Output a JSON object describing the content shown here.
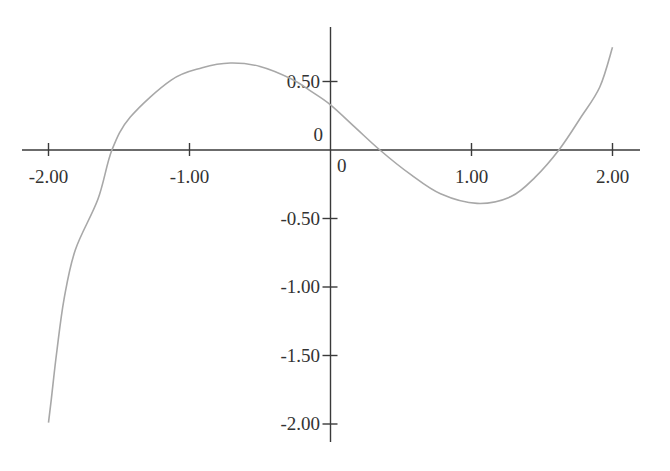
{
  "chart_data": {
    "type": "line",
    "title": "",
    "xlabel": "",
    "ylabel": "",
    "xlim": [
      -2.2,
      2.2
    ],
    "ylim": [
      -2.1,
      0.9
    ],
    "grid": false,
    "legend": null,
    "x_ticks": [
      {
        "value": -2,
        "label": "-2.00"
      },
      {
        "value": -1,
        "label": "-1.00"
      },
      {
        "value": 1,
        "label": "1.00"
      },
      {
        "value": 2,
        "label": "2.00"
      }
    ],
    "y_ticks": [
      {
        "value": 0.5,
        "label": "0.50"
      },
      {
        "value": -0.5,
        "label": "-0.50"
      },
      {
        "value": -1,
        "label": "-1.00"
      },
      {
        "value": -1.5,
        "label": "-1.50"
      },
      {
        "value": -2,
        "label": "-2.00"
      }
    ],
    "origin_labels": {
      "x_zero": "0",
      "y_zero": "0"
    },
    "series": [
      {
        "name": "f(x)",
        "color": "#a8a8a8",
        "x": [
          -2.0,
          -1.98,
          -1.94,
          -1.89,
          -1.81,
          -1.65,
          -1.55,
          -1.42,
          -1.13,
          -0.91,
          -0.71,
          -0.5,
          -0.28,
          -0.14,
          0.0,
          0.18,
          0.35,
          0.57,
          0.78,
          1.04,
          1.28,
          1.45,
          1.62,
          1.77,
          1.91,
          2.0
        ],
        "y": [
          -1.99,
          -1.82,
          -1.46,
          -1.09,
          -0.73,
          -0.36,
          0.0,
          0.24,
          0.51,
          0.6,
          0.635,
          0.61,
          0.52,
          0.43,
          0.33,
          0.16,
          0.0,
          -0.18,
          -0.32,
          -0.39,
          -0.34,
          -0.2,
          0.0,
          0.23,
          0.46,
          0.75
        ]
      }
    ],
    "axis_color": "#3a3a3a",
    "curve_color": "#a8a8a8"
  }
}
